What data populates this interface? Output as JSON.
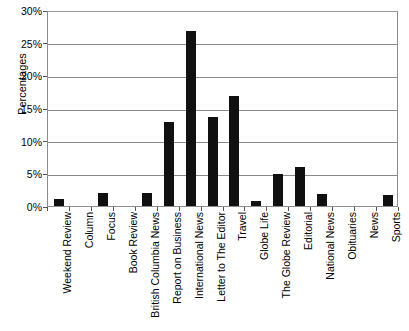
{
  "chart_data": {
    "type": "bar",
    "title": "",
    "xlabel": "",
    "ylabel": "Percentages",
    "ylim": [
      0,
      30
    ],
    "ytick_labels": [
      "30%",
      "25%",
      "20%",
      "15%",
      "10%",
      "5%",
      "0%"
    ],
    "ytick_values": [
      30,
      25,
      20,
      15,
      10,
      5,
      0
    ],
    "grid": true,
    "legend": null,
    "bar_color": "#101010",
    "categories": [
      "Weekend Review",
      "Column",
      "Focus",
      "Book Review",
      "British Columbia News",
      "Report on Business",
      "International News",
      "Letter to The Editor",
      "Travel",
      "Globe Life",
      "The Globe Review",
      "Editorial",
      "National News",
      "Obituaries",
      "News",
      "Sports"
    ],
    "values": [
      1.0,
      0.0,
      2.0,
      0.0,
      2.0,
      12.8,
      26.8,
      13.7,
      16.9,
      0.8,
      4.9,
      6.0,
      1.8,
      0.0,
      0.0,
      1.7
    ]
  }
}
